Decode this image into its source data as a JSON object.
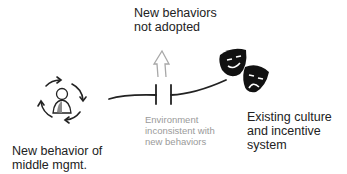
{
  "diagram": {
    "nodes": [
      {
        "id": "middle-mgmt",
        "icon": "person-cycle-icon",
        "label": "New behavior of\nmiddle mgmt."
      },
      {
        "id": "culture",
        "icon": "theater-masks-icon",
        "label": "Existing culture\nand incentive\nsystem"
      }
    ],
    "connector": {
      "style": "capacitor-break",
      "label": "Environment\ninconsistent with\nnew behaviors"
    },
    "outcome": {
      "icon": "up-arrow-outline-icon",
      "label": "New behaviors\nnot adopted"
    },
    "colors": {
      "text": "#222222",
      "muted": "#9a9a9a",
      "line": "#222222",
      "arrow": "#a0a0a0",
      "person_head": "#8c8c8c"
    }
  }
}
